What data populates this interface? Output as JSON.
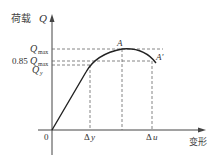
{
  "diagram": {
    "y_axis_label_cn": "荷载",
    "y_axis_label_sym": "Q",
    "x_axis_label": "变形",
    "origin_label": "0",
    "y_ticks": [
      {
        "prefix": "",
        "sym": "Q",
        "sub": "max"
      },
      {
        "prefix": "0.85",
        "sym": "Q",
        "sub": "max"
      },
      {
        "prefix": "",
        "sym": "Q",
        "sub": "y"
      }
    ],
    "x_ticks": [
      {
        "sym": "Δ",
        "var": "y"
      },
      {
        "sym": "Δ",
        "var": "u"
      }
    ],
    "points": [
      {
        "label": "A"
      },
      {
        "label": "A′"
      }
    ],
    "colors": {
      "curve": "#222222",
      "axes": "#444444",
      "dashed": "#555555"
    }
  }
}
